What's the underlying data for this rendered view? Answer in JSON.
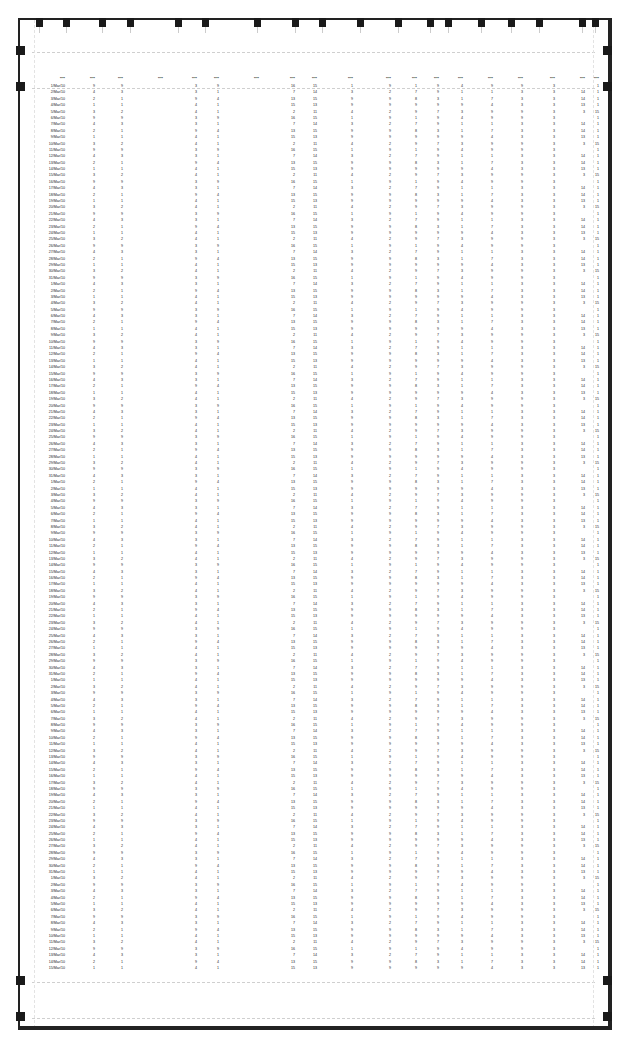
{
  "view": {
    "type": "print-preview",
    "description": "Spreadsheet page shown in page-layout/print preview with margin and column-width handles",
    "legibility": "header labels and cell values are too small/blurry to read exactly; values below are approximate placeholders"
  },
  "header": {
    "columns": [
      {
        "label": "Date"
      },
      {
        "label": "illegible col 1"
      },
      {
        "label": "illegible col 2"
      },
      {
        "label": "illegible col 3"
      },
      {
        "label": "illegible col 4"
      },
      {
        "label": "illegible col 5"
      },
      {
        "label": "illegible col 6"
      },
      {
        "label": "illegible col 7"
      },
      {
        "label": "illegible col 8"
      },
      {
        "label": "illegible col 9"
      },
      {
        "label": "illegible col 10"
      },
      {
        "label": "illegible col 11"
      },
      {
        "label": "illegible col 12"
      },
      {
        "label": "illegible col 13"
      },
      {
        "label": "illegible col 14"
      },
      {
        "label": "illegible col 15"
      },
      {
        "label": "illegible col 16"
      },
      {
        "label": "illegible col 17"
      },
      {
        "label": "illegible col 18"
      }
    ]
  },
  "table": {
    "row_count_approx": 139,
    "value_range_approx": [
      0,
      16
    ],
    "date_format_approx": "d/Mon/yy",
    "sample_rows_approx": [
      [
        "1/Mar/10",
        "9",
        "9",
        "",
        "3",
        "9",
        "",
        "16",
        "15",
        "1",
        "9",
        "1",
        "9",
        "4",
        "9",
        "9",
        "3",
        "",
        "1"
      ],
      [
        "2/Mar/10",
        "4",
        "3",
        "",
        "3",
        "1",
        "",
        "7",
        "14",
        "3",
        "2",
        "7",
        "9",
        "1",
        "1",
        "3",
        "3",
        "14",
        "1"
      ],
      [
        "3/Mar/10",
        "2",
        "1",
        "",
        "9",
        "4",
        "",
        "13",
        "15",
        "9",
        "9",
        "8",
        "3",
        "1",
        "7",
        "3",
        "3",
        "14",
        "1"
      ],
      [
        "4/Mar/10",
        "1",
        "1",
        "",
        "4",
        "1",
        "",
        "15",
        "13",
        "9",
        "9",
        "9",
        "9",
        "9",
        "4",
        "3",
        "3",
        "13",
        "1"
      ],
      [
        "5/Mar/10",
        "3",
        "2",
        "",
        "4",
        "1",
        "",
        "2",
        "11",
        "4",
        "2",
        "9",
        "7",
        "3",
        "9",
        "9",
        "3",
        "3",
        "15"
      ]
    ]
  },
  "page_handles": {
    "top_column_handles_x": [
      37,
      64,
      100,
      128,
      176,
      203,
      255,
      293,
      320,
      358,
      396,
      428,
      446,
      479,
      509,
      537,
      580,
      593
    ],
    "left_margin_handles_y": [
      53,
      89,
      1002,
      1038
    ],
    "right_margin_handles_y": [
      53,
      89,
      1002,
      1038
    ]
  },
  "colors": {
    "frame": "#222222",
    "handle": "#1a1a1a",
    "margin_guide": "#cfcfcf",
    "background": "#ffffff"
  }
}
